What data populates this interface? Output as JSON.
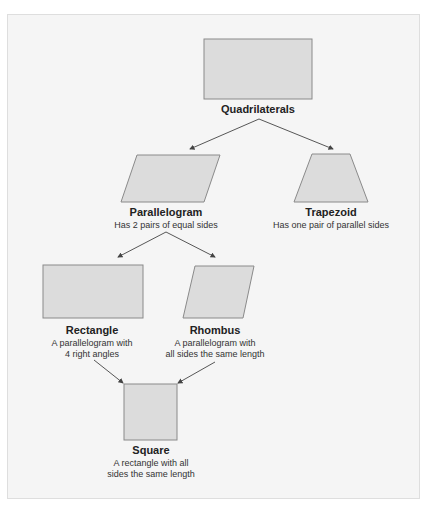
{
  "colors": {
    "shape_fill": "#dcdcdc",
    "shape_stroke": "#8a8a8a",
    "arrow": "#444444",
    "background": "#f5f5f5"
  },
  "nodes": {
    "quadrilaterals": {
      "title": "Quadrilaterals",
      "desc": []
    },
    "parallelogram": {
      "title": "Parallelogram",
      "desc": [
        "Has 2 pairs of equal sides"
      ]
    },
    "trapezoid": {
      "title": "Trapezoid",
      "desc": [
        "Has one pair of parallel sides"
      ]
    },
    "rectangle": {
      "title": "Rectangle",
      "desc": [
        "A parallelogram with",
        "4 right angles"
      ]
    },
    "rhombus": {
      "title": "Rhombus",
      "desc": [
        "A parallelogram with",
        "all sides the same length"
      ]
    },
    "square": {
      "title": "Square",
      "desc": [
        "A rectangle with all",
        "sides the same length"
      ]
    }
  },
  "edges": [
    {
      "from": "quadrilaterals",
      "to": "parallelogram"
    },
    {
      "from": "quadrilaterals",
      "to": "trapezoid"
    },
    {
      "from": "parallelogram",
      "to": "rectangle"
    },
    {
      "from": "parallelogram",
      "to": "rhombus"
    },
    {
      "from": "rectangle",
      "to": "square"
    },
    {
      "from": "rhombus",
      "to": "square"
    }
  ]
}
